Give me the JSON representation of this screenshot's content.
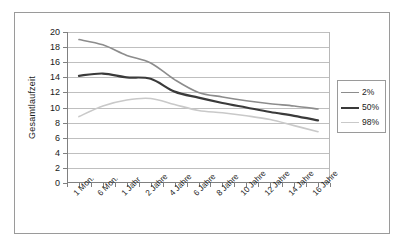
{
  "chart_data": {
    "type": "line",
    "title": "",
    "xlabel": "",
    "ylabel": "Gesamtlaufzeit",
    "ylim": [
      0,
      20
    ],
    "ytick_step": 2,
    "yticks": [
      "0",
      "2",
      "4",
      "6",
      "8",
      "10",
      "12",
      "14",
      "16",
      "18",
      "20"
    ],
    "grid": true,
    "legend_position": "right",
    "categories": [
      "1 Mon.",
      "6 Mon.",
      "1 Jahr",
      "2 Jahre",
      "4 Jahre",
      "6 Jahre",
      "8 Jahre",
      "10 Jahre",
      "12 Jahre",
      "14 Jahre",
      "16 Jahre"
    ],
    "series": [
      {
        "name": "2%",
        "color": "#8c8c8c",
        "width": 1.6,
        "values": [
          19.0,
          18.3,
          16.9,
          15.9,
          13.7,
          12.0,
          11.4,
          10.9,
          10.5,
          10.2,
          9.8
        ]
      },
      {
        "name": "50%",
        "color": "#3a3a3a",
        "width": 2.2,
        "values": [
          14.2,
          14.5,
          14.0,
          13.8,
          12.1,
          11.3,
          10.6,
          10.0,
          9.4,
          8.9,
          8.3
        ]
      },
      {
        "name": "98%",
        "color": "#c9c9c9",
        "width": 1.6,
        "values": [
          8.8,
          10.2,
          11.0,
          11.2,
          10.4,
          9.6,
          9.3,
          8.9,
          8.4,
          7.6,
          6.8
        ]
      }
    ]
  },
  "legend": {
    "entries": [
      {
        "label": "2%"
      },
      {
        "label": "50%"
      },
      {
        "label": "98%"
      }
    ]
  },
  "axes": {
    "y_title": "Gesamtlaufzeit"
  }
}
